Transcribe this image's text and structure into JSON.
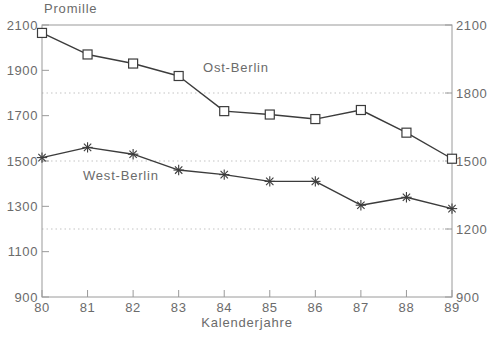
{
  "chart_data": {
    "type": "line",
    "title": "Promille",
    "xlabel": "Kalenderjahre",
    "ylabel": "Promille",
    "x": [
      80,
      81,
      82,
      83,
      84,
      85,
      86,
      87,
      88,
      89
    ],
    "x_tick_labels": [
      "80",
      "81",
      "82",
      "83",
      "84",
      "85",
      "86",
      "87",
      "88",
      "89"
    ],
    "series": [
      {
        "name": "Ost-Berlin",
        "marker": "square",
        "values": [
          2065,
          1970,
          1930,
          1875,
          1720,
          1705,
          1685,
          1725,
          1625,
          1510
        ]
      },
      {
        "name": "West-Berlin",
        "marker": "asterisk",
        "values": [
          1515,
          1560,
          1530,
          1460,
          1440,
          1410,
          1410,
          1305,
          1340,
          1290
        ]
      }
    ],
    "ylim": [
      900,
      2100
    ],
    "left_axis_ticks": [
      2100,
      1900,
      1700,
      1500,
      1300,
      1100,
      900
    ],
    "right_axis_ticks": [
      2100,
      1800,
      1500,
      1200,
      900
    ],
    "gridlines_at": [
      1800,
      1500,
      1200
    ],
    "grid_style": "dotted",
    "legend_position": "inline-annotations"
  },
  "annotations": {
    "ost_label": "Ost-Berlin",
    "west_label": "West-Berlin"
  },
  "colors": {
    "series_line": "#3c3c3c",
    "marker": "#3c3c3c",
    "frame": "#9a9a9a",
    "grid_dots": "#c3c3c3",
    "text": "#6b6b6b",
    "background": "#ffffff"
  }
}
